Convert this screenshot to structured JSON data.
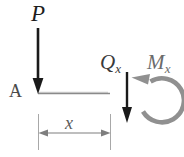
{
  "figure": {
    "type": "free-body-diagram",
    "background_color": "#ffffff"
  },
  "labels": {
    "applied_load": {
      "symbol": "P",
      "style": "italic",
      "color": "#1d1d1d"
    },
    "support_point": {
      "symbol": "A",
      "style": "upright",
      "color": "#4a4a4a"
    },
    "shear_force": {
      "symbol": "Q",
      "subscript": "x",
      "style": "italic",
      "color": "#3a3a3a"
    },
    "bending_moment": {
      "symbol": "M",
      "subscript": "x",
      "style": "italic",
      "color": "#6b6b6b"
    },
    "dimension": {
      "symbol": "x",
      "style": "italic",
      "color": "#5b5b5b"
    }
  },
  "elements": {
    "beam_line": {
      "name": "beam",
      "color": "#7d7d7d",
      "x_start": 38,
      "x_end": 110,
      "y": 93
    },
    "load_arrow_P": {
      "name": "downward-point-load",
      "color": "#1a1a1a",
      "x": 38,
      "y_start": 28,
      "y_end": 93,
      "direction": "down"
    },
    "shear_arrow_Q": {
      "name": "downward-shear-force",
      "color": "#1a1a1a",
      "x": 127,
      "y_start": 72,
      "y_end": 123,
      "direction": "down"
    },
    "moment_arc_M": {
      "name": "counterclockwise-moment",
      "color": "#8e8e8e",
      "center_x": 158,
      "center_y": 99,
      "radius": 22,
      "direction": "counterclockwise"
    },
    "dimension_line": {
      "name": "x-dimension",
      "color": "#8a8a8a",
      "y": 133,
      "x_start": 38,
      "x_end": 110,
      "extension_top": 114,
      "extension_bottom": 150
    }
  }
}
